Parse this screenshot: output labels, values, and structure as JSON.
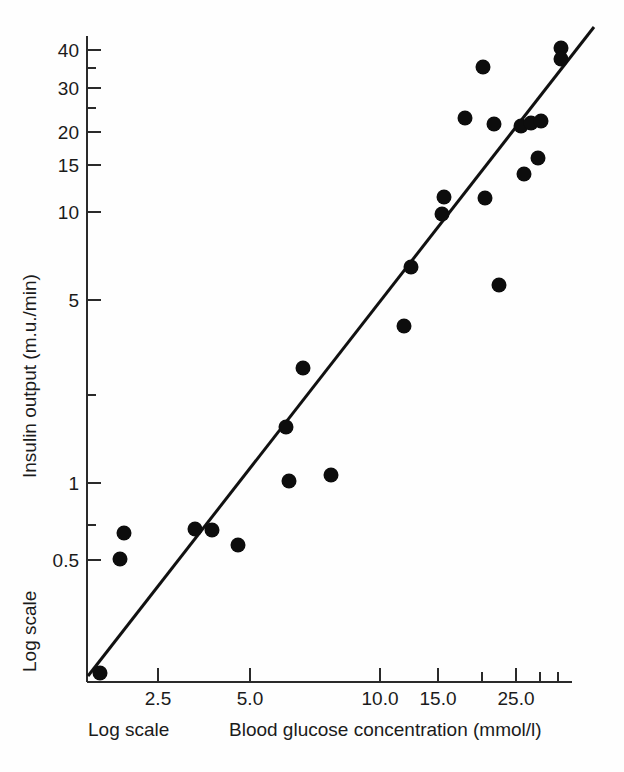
{
  "figure": {
    "background_color": "#fefefe",
    "ink_color": "#111111"
  },
  "axes": {
    "y_title": "Insulin output (m.u./min)",
    "x_title": "Blood glucose concentration (mmol/l)",
    "y_scale_note": "Log scale",
    "x_scale_note": "Log scale"
  },
  "chart_data": {
    "type": "scatter",
    "title": "",
    "subtitle": "",
    "xlabel": "Blood glucose concentration (mmol/l)",
    "ylabel": "Insulin output (m.u./min)",
    "xscale": "log",
    "yscale": "log",
    "grid": false,
    "legend": null,
    "annotations": [
      "Log scale",
      "Log scale"
    ],
    "xlim": [
      1.6,
      40.0
    ],
    "ylim": [
      0.3,
      48.0
    ],
    "xticks_labeled": [
      {
        "value": 2.5,
        "label": "2.5",
        "px": 158
      },
      {
        "value": 5.0,
        "label": "5.0",
        "px": 250
      },
      {
        "value": 10.0,
        "label": "10.0",
        "px": 380
      },
      {
        "value": 15.0,
        "label": "15.0",
        "px": 438
      },
      {
        "value": 25.0,
        "label": "25.0",
        "px": 516
      }
    ],
    "xticks_minor": [
      {
        "value": 20.0,
        "px": 482
      },
      {
        "value": 30.0,
        "px": 540
      },
      {
        "value": 35.0,
        "px": 558
      }
    ],
    "yticks_labeled": [
      {
        "value": 40,
        "label": "40",
        "px": 50
      },
      {
        "value": 30,
        "label": "30",
        "px": 88
      },
      {
        "value": 20,
        "label": "20",
        "px": 132
      },
      {
        "value": 15,
        "label": "15",
        "px": 165
      },
      {
        "value": 10,
        "label": "10",
        "px": 212
      },
      {
        "value": 5,
        "label": "5",
        "px": 300
      },
      {
        "value": 1,
        "label": "1",
        "px": 483
      },
      {
        "value": 0.5,
        "label": "0.5",
        "px": 560
      }
    ],
    "yticks_minor": [
      {
        "value": 35,
        "px": 68
      },
      {
        "value": 25,
        "px": 108
      },
      {
        "value": 2,
        "px": 395
      },
      {
        "value": 0.7,
        "px": 525
      }
    ],
    "points": [
      {
        "x": 1.9,
        "y": 0.34,
        "px": 100,
        "py": 673
      },
      {
        "x": 2.1,
        "y": 0.51,
        "px": 120,
        "py": 559
      },
      {
        "x": 2.15,
        "y": 0.62,
        "px": 124,
        "py": 533
      },
      {
        "x": 3.4,
        "y": 0.73,
        "px": 195,
        "py": 529
      },
      {
        "x": 3.7,
        "y": 0.73,
        "px": 212,
        "py": 530
      },
      {
        "x": 4.4,
        "y": 0.62,
        "px": 238,
        "py": 545
      },
      {
        "x": 6.3,
        "y": 1.05,
        "px": 289,
        "py": 481
      },
      {
        "x": 6.1,
        "y": 1.85,
        "px": 286,
        "py": 427
      },
      {
        "x": 6.6,
        "y": 2.9,
        "px": 303,
        "py": 368
      },
      {
        "x": 8.0,
        "y": 1.1,
        "px": 331,
        "py": 475
      },
      {
        "x": 12.0,
        "y": 4.0,
        "px": 404,
        "py": 326
      },
      {
        "x": 12.5,
        "y": 6.4,
        "px": 411,
        "py": 267
      },
      {
        "x": 15.0,
        "y": 10.0,
        "px": 442,
        "py": 214
      },
      {
        "x": 15.2,
        "y": 11.5,
        "px": 444,
        "py": 197
      },
      {
        "x": 17.5,
        "y": 22.0,
        "px": 465,
        "py": 118
      },
      {
        "x": 19.5,
        "y": 35.0,
        "px": 483,
        "py": 67
      },
      {
        "x": 19.8,
        "y": 11.5,
        "px": 485,
        "py": 198
      },
      {
        "x": 21.0,
        "y": 21.0,
        "px": 494,
        "py": 124
      },
      {
        "x": 21.5,
        "y": 5.7,
        "px": 499,
        "py": 285
      },
      {
        "x": 25.0,
        "y": 21.0,
        "px": 521,
        "py": 126
      },
      {
        "x": 25.5,
        "y": 13.5,
        "px": 524,
        "py": 174
      },
      {
        "x": 26.0,
        "y": 21.5,
        "px": 531,
        "py": 123
      },
      {
        "x": 27.5,
        "y": 15.5,
        "px": 538,
        "py": 158
      },
      {
        "x": 27.0,
        "y": 22.0,
        "px": 541,
        "py": 121
      },
      {
        "x": 32.0,
        "y": 38.0,
        "px": 561,
        "py": 48
      },
      {
        "x": 32.0,
        "y": 34.0,
        "px": 561,
        "py": 59
      }
    ],
    "fit_line": {
      "label": "regression line",
      "px_start": [
        88,
        676
      ],
      "px_end": [
        594,
        27
      ]
    }
  }
}
